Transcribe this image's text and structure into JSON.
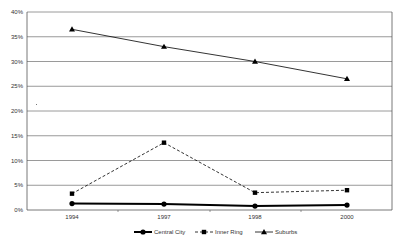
{
  "chart_data": {
    "type": "line",
    "title": "",
    "xlabel": "",
    "ylabel": "",
    "categories": [
      "1994",
      "1997",
      "1998",
      "2000"
    ],
    "ylim": [
      0,
      40
    ],
    "yticks": [
      "0%",
      "5%",
      "10%",
      "15%",
      "20%",
      "25%",
      "30%",
      "35%",
      "40%"
    ],
    "grid": true,
    "legend_position": "bottom",
    "series": [
      {
        "name": "Central City",
        "marker": "circle",
        "line": "solid-thick",
        "values": [
          1.3,
          1.2,
          0.8,
          1.0
        ]
      },
      {
        "name": "Inner Ring",
        "marker": "square",
        "line": "dashed",
        "values": [
          3.3,
          13.6,
          3.5,
          4.0
        ]
      },
      {
        "name": "Suburbs",
        "marker": "triangle",
        "line": "solid",
        "values": [
          36.5,
          33.0,
          30.0,
          26.5
        ]
      }
    ]
  },
  "colors": {
    "line": "#000000",
    "grid": "#808080",
    "text": "#333333"
  }
}
